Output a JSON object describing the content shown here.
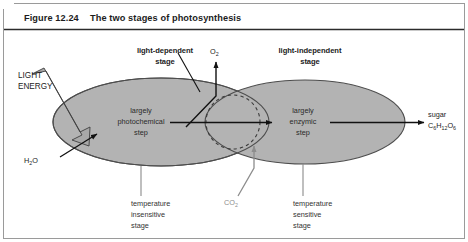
{
  "figure": {
    "number_label": "Figure 12.24",
    "title": "The two stages of photosynthesis"
  },
  "stages": {
    "left": {
      "heading_line1": "light-dependent",
      "heading_line2": "stage",
      "inner_line1": "largely",
      "inner_line2": "photochemical",
      "inner_line3": "step",
      "bottom_line1": "temperature",
      "bottom_line2": "insensitive",
      "bottom_line3": "stage"
    },
    "right": {
      "heading_line1": "light-independent",
      "heading_line2": "stage",
      "inner_line1": "largely",
      "inner_line2": "enzymic",
      "inner_line3": "step",
      "bottom_line1": "temperature",
      "bottom_line2": "sensitive",
      "bottom_line3": "stage"
    }
  },
  "inputs": {
    "light_energy_line1": "LIGHT",
    "light_energy_line2": "ENERGY",
    "water_formula": "H",
    "water_sub1": "2",
    "water_rest": "O",
    "co2_formula": "CO",
    "co2_sub": "2"
  },
  "outputs": {
    "oxygen_formula": "O",
    "oxygen_sub": "2",
    "sugar_label": "sugar",
    "sugar_formula_c": "C",
    "sugar_sub_c": "6",
    "sugar_formula_h": "H",
    "sugar_sub_h": "12",
    "sugar_formula_o": "O",
    "sugar_sub_o": "6"
  },
  "colors": {
    "ellipse_fill": "#b3b3b3",
    "ellipse_stroke": "#4d4d4d",
    "arrow_black": "#111111",
    "co2_gray": "#8d8d8d",
    "leader_gray": "#8a8a8a",
    "frame": "#9a9a9a",
    "title_rule": "#2b2b2b",
    "light_arrow_fill": "#a8a8a8"
  }
}
